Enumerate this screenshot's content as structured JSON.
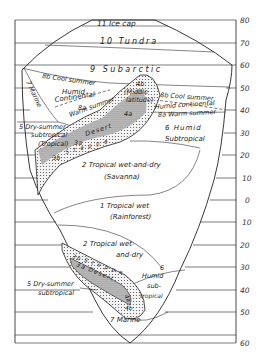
{
  "diagram": {
    "axis": {
      "ticks": [
        "80",
        "70",
        "60",
        "50",
        "40",
        "30",
        "20",
        "10",
        "0",
        "10",
        "20",
        "30",
        "40",
        "50",
        "60"
      ]
    },
    "regions": {
      "ice_cap": "11 Ice cap",
      "tundra": "10 Tundra",
      "subarctic": "9 Subarctic",
      "cool_summer_left": "8b Cool summer",
      "humid_continental_left_1": "Humid",
      "humid_continental_left_2": "Continental",
      "warm_summer_left_1": "8a",
      "warm_summer_left_2": "Warm summer",
      "marine_north": "7 Marine",
      "middle_latitude_1": "4b",
      "middle_latitude_2": "(Middle",
      "middle_latitude_3": "latitude)",
      "desert_4a": "4a",
      "cool_summer_right": "8b Cool summer",
      "humid_continental_right": "Humid continental",
      "warm_summer_right": "8a Warm summer",
      "dry_summer_north_1": "5 Dry-summer",
      "dry_summer_north_2": "subtropical",
      "tropical_north": "(Tropical)",
      "desert_3a_north": "3a",
      "desert_north": "Desert",
      "steppe_3b_north": "3b",
      "steppe_letters_north": "S t e p p e",
      "humid_subtropical_north_1": "6 Humid",
      "humid_subtropical_north_2": "Subtropical",
      "savanna_north_1": "2 Tropical wet-and-dry",
      "savanna_north_2": "(Savanna)",
      "rainforest_1": "1 Tropical wet",
      "rainforest_2": "(Rainforest)",
      "savanna_south_1": "2 Tropical wet-",
      "savanna_south_2": "and-dry",
      "steppe_south": "3b S t e p p e",
      "desert_south": "3a Desert",
      "desert_4a_south": "4a",
      "desert_4b_south": "4b",
      "humid_subtropical_south_1": "6",
      "humid_subtropical_south_2": "Humid",
      "humid_subtropical_south_3": "sub-",
      "humid_subtropical_south_4": "tropical",
      "dry_summer_south_1": "5 Dry-summer",
      "dry_summer_south_2": "subtropical",
      "marine_south": "7 Marine"
    }
  }
}
